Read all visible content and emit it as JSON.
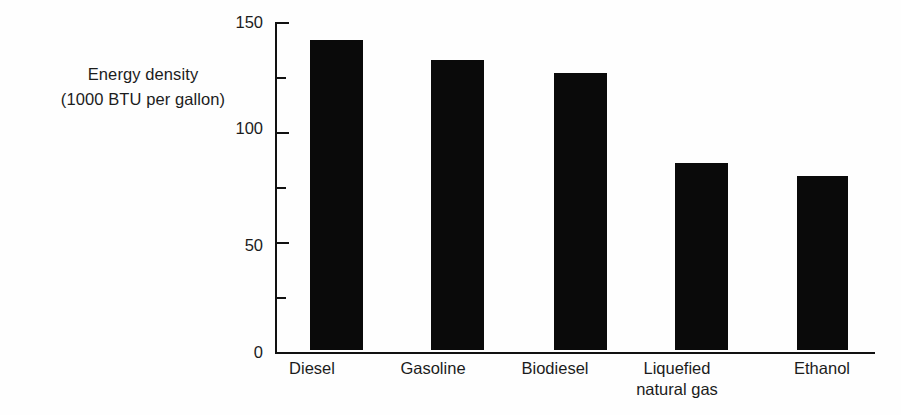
{
  "chart_data": {
    "type": "bar",
    "title": "",
    "subtitle": "",
    "xlabel": "",
    "ylabel_lines": [
      "Energy density",
      "(1000 BTU per gallon)"
    ],
    "ylabel": "Energy density (1000 BTU per gallon)",
    "categories": [
      "Diesel",
      "Gasoline",
      "Biodiesel",
      "Liquefied natural gas",
      "Ethanol"
    ],
    "category_label_lines": [
      [
        "Diesel"
      ],
      [
        "Gasoline"
      ],
      [
        "Biodiesel"
      ],
      [
        "Liquefied",
        "natural gas"
      ],
      [
        "Ethanol"
      ]
    ],
    "values": [
      141,
      132,
      126,
      85,
      79
    ],
    "ylim": [
      0,
      150
    ],
    "yticks": [
      0,
      50,
      100,
      150
    ],
    "ytick_labels": [
      "0",
      "50",
      "100",
      "150"
    ],
    "yminor_ticks": [
      25,
      75,
      125
    ],
    "grid": false,
    "legend": false,
    "legend_position": "none",
    "bar_color": "#0a0a0a",
    "axis_color": "#111111",
    "background_color": "#fefefe"
  },
  "axis": {
    "y_tick_0": "0",
    "y_tick_50": "50",
    "y_tick_100": "100",
    "y_tick_150": "150"
  },
  "categories_text": {
    "c0_l0": "Diesel",
    "c1_l0": "Gasoline",
    "c2_l0": "Biodiesel",
    "c3_l0": "Liquefied",
    "c3_l1": "natural gas",
    "c4_l0": "Ethanol"
  },
  "ylabel_text": {
    "l0": "Energy density",
    "l1": "(1000 BTU per gallon)"
  }
}
